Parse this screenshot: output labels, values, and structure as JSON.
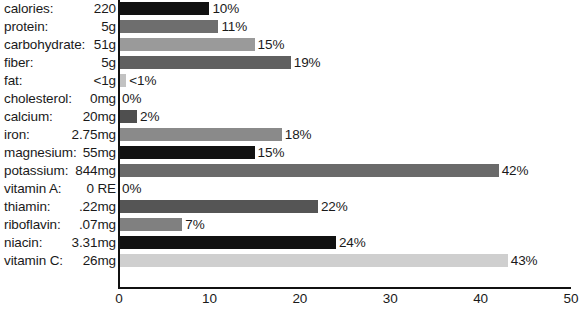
{
  "chart_data": {
    "type": "bar",
    "orientation": "horizontal",
    "title": "",
    "xlabel": "",
    "ylabel": "",
    "xlim": [
      0,
      50
    ],
    "xticks": [
      "0",
      "10",
      "20",
      "30",
      "40",
      "50"
    ],
    "grid": false,
    "legend": false,
    "categories": [
      "calories:",
      "protein:",
      "carbohydrate:",
      "fiber:",
      "fat:",
      "cholesterol:",
      "calcium:",
      "iron:",
      "magnesium:",
      "potassium:",
      "vitamin A:",
      "thiamin:",
      "riboflavin:",
      "niacin:",
      "vitamin C:"
    ],
    "amounts": [
      "220",
      "5g",
      "51g",
      "5g",
      "<1g",
      "0mg",
      "20mg",
      "2.75mg",
      "55mg",
      "844mg",
      "0 RE",
      ".22mg",
      ".07mg",
      "3.31mg",
      "26mg"
    ],
    "values": [
      10,
      11,
      15,
      19,
      0.8,
      0,
      2,
      18,
      15,
      42,
      0,
      22,
      7,
      24,
      43
    ],
    "value_labels": [
      "10%",
      "11%",
      "15%",
      "19%",
      "<1%",
      "0%",
      "2%",
      "18%",
      "15%",
      "42%",
      "0%",
      "22%",
      "7%",
      "24%",
      "43%"
    ],
    "bar_colors": [
      "#111111",
      "#6e6e6e",
      "#9a9a9a",
      "#606060",
      "#c2c2c2",
      "#ffffff",
      "#4f4f4f",
      "#8a8a8a",
      "#111111",
      "#6a6a6a",
      "#ffffff",
      "#555555",
      "#808080",
      "#111111",
      "#cfcfcf"
    ]
  },
  "axis": {
    "line_color": "#111111"
  }
}
